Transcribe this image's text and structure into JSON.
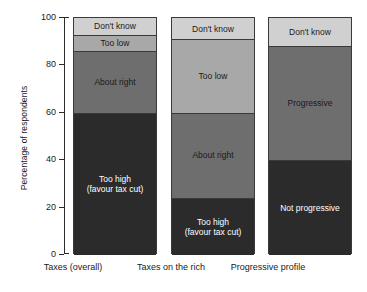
{
  "chart_data": {
    "type": "bar",
    "subtype": "stacked-bar",
    "title": "",
    "xlabel": "",
    "ylabel": "Percentage of respondents",
    "ylim": [
      0,
      100
    ],
    "yticks": [
      0,
      20,
      40,
      60,
      80,
      100
    ],
    "grid": false,
    "legend": "none (segments labelled in place)",
    "categories": [
      "Taxes (overall)",
      "Taxes on the rich",
      "Progressive profile"
    ],
    "series": [
      {
        "name": "Too high (favour tax cut)",
        "values": [
          60,
          24,
          null
        ],
        "color": "#2b2b2b"
      },
      {
        "name": "About right",
        "values": [
          26,
          36,
          null
        ],
        "color": "#6e6e6e"
      },
      {
        "name": "Too low",
        "values": [
          7,
          31,
          null
        ],
        "color": "#a8a8a8"
      },
      {
        "name": "Not progressive",
        "values": [
          null,
          null,
          40
        ],
        "color": "#2b2b2b"
      },
      {
        "name": "Progressive",
        "values": [
          null,
          null,
          48
        ],
        "color": "#6e6e6e"
      },
      {
        "name": "Don't know",
        "values": [
          7,
          9,
          12
        ],
        "color": "#d0d0d0"
      }
    ],
    "bars": [
      {
        "category": "Taxes (overall)",
        "segments": [
          {
            "label": "Too high\n(favour tax cut)",
            "from": 0,
            "to": 60,
            "value": 60,
            "color": "#2b2b2b",
            "text_color": "#ffffff"
          },
          {
            "label": "About right",
            "from": 60,
            "to": 86,
            "value": 26,
            "color": "#6e6e6e",
            "text_color": "#1a1a1a"
          },
          {
            "label": "Too low",
            "from": 86,
            "to": 93,
            "value": 7,
            "color": "#a8a8a8",
            "text_color": "#1a1a1a"
          },
          {
            "label": "Don't know",
            "from": 93,
            "to": 100,
            "value": 7,
            "color": "#d0d0d0",
            "text_color": "#1a1a1a"
          }
        ]
      },
      {
        "category": "Taxes on the rich",
        "segments": [
          {
            "label": "Too high\n(favour tax cut)",
            "from": 0,
            "to": 24,
            "value": 24,
            "color": "#2b2b2b",
            "text_color": "#ffffff"
          },
          {
            "label": "About right",
            "from": 24,
            "to": 60,
            "value": 36,
            "color": "#6e6e6e",
            "text_color": "#1a1a1a"
          },
          {
            "label": "Too low",
            "from": 60,
            "to": 91,
            "value": 31,
            "color": "#a8a8a8",
            "text_color": "#1a1a1a"
          },
          {
            "label": "Don't know",
            "from": 91,
            "to": 100,
            "value": 9,
            "color": "#d0d0d0",
            "text_color": "#1a1a1a"
          }
        ]
      },
      {
        "category": "Progressive profile",
        "segments": [
          {
            "label": "Not progressive",
            "from": 0,
            "to": 40,
            "value": 40,
            "color": "#2b2b2b",
            "text_color": "#ffffff"
          },
          {
            "label": "Progressive",
            "from": 40,
            "to": 88,
            "value": 48,
            "color": "#6e6e6e",
            "text_color": "#1a1a1a"
          },
          {
            "label": "Don't know",
            "from": 88,
            "to": 100,
            "value": 12,
            "color": "#d0d0d0",
            "text_color": "#1a1a1a"
          }
        ]
      }
    ]
  }
}
